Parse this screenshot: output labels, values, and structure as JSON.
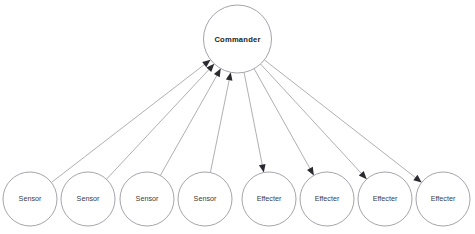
{
  "diagram": {
    "type": "hub-and-spoke",
    "canvas": {
      "width": 475,
      "height": 234
    },
    "colors": {
      "background": "#ffffff",
      "node_stroke": "#9a9aa2",
      "node_fill": "#ffffff",
      "edge_stroke": "#9a9aa2",
      "arrow_fill": "#2a2a30",
      "label_text": "#3a3a40",
      "root_label_text": "#1d1d22"
    },
    "root": {
      "id": "commander",
      "label": "Commander",
      "cx": 237.5,
      "cy": 39,
      "r": 34
    },
    "nodes": [
      {
        "id": "sensor-1",
        "label": "Sensor",
        "role": "sensor",
        "cx": 30,
        "cy": 199,
        "r": 27
      },
      {
        "id": "sensor-2",
        "label": "Sensor",
        "role": "sensor",
        "cx": 88,
        "cy": 199,
        "r": 27
      },
      {
        "id": "sensor-3",
        "label": "Sensor",
        "role": "sensor",
        "cx": 147,
        "cy": 199,
        "r": 27
      },
      {
        "id": "sensor-4",
        "label": "Sensor",
        "role": "sensor",
        "cx": 205,
        "cy": 199,
        "r": 27
      },
      {
        "id": "effecter-1",
        "label": "Effecter",
        "role": "effecter",
        "cx": 269,
        "cy": 199,
        "r": 27
      },
      {
        "id": "effecter-2",
        "label": "Effecter",
        "role": "effecter",
        "cx": 327,
        "cy": 199,
        "r": 27
      },
      {
        "id": "effecter-3",
        "label": "Effecter",
        "role": "effecter",
        "cx": 385,
        "cy": 199,
        "r": 27
      },
      {
        "id": "effecter-4",
        "label": "Effecter",
        "role": "effecter",
        "cx": 443,
        "cy": 199,
        "r": 27
      }
    ],
    "edges": [
      {
        "id": "edge-sensor-1",
        "from": "sensor-1",
        "to": "commander",
        "direction": "to-commander",
        "arrow_at": "commander"
      },
      {
        "id": "edge-sensor-2",
        "from": "sensor-2",
        "to": "commander",
        "direction": "to-commander",
        "arrow_at": "commander"
      },
      {
        "id": "edge-sensor-3",
        "from": "sensor-3",
        "to": "commander",
        "direction": "to-commander",
        "arrow_at": "commander"
      },
      {
        "id": "edge-sensor-4",
        "from": "sensor-4",
        "to": "commander",
        "direction": "to-commander",
        "arrow_at": "commander"
      },
      {
        "id": "edge-effecter-1",
        "from": "commander",
        "to": "effecter-1",
        "direction": "from-commander",
        "arrow_at": "effecter-1"
      },
      {
        "id": "edge-effecter-2",
        "from": "commander",
        "to": "effecter-2",
        "direction": "from-commander",
        "arrow_at": "effecter-2"
      },
      {
        "id": "edge-effecter-3",
        "from": "commander",
        "to": "effecter-3",
        "direction": "from-commander",
        "arrow_at": "effecter-3"
      },
      {
        "id": "edge-effecter-4",
        "from": "commander",
        "to": "effecter-4",
        "direction": "from-commander",
        "arrow_at": "effecter-4"
      }
    ]
  }
}
